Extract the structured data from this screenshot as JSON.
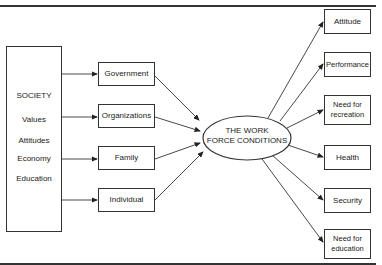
{
  "diagram": {
    "society": {
      "title": "SOCIETY",
      "items": [
        "Values",
        "Attitudes",
        "Economy",
        "Education"
      ]
    },
    "influences": [
      "Government",
      "Organizations",
      "Family",
      "Individual"
    ],
    "center": {
      "line1": "THE WORK",
      "line2": "FORCE CONDITIONS"
    },
    "outcomes": [
      {
        "line1": "Attitude",
        "line2": ""
      },
      {
        "line1": "Performance",
        "line2": ""
      },
      {
        "line1": "Need for",
        "line2": "recreation"
      },
      {
        "line1": "Health",
        "line2": ""
      },
      {
        "line1": "Security",
        "line2": ""
      },
      {
        "line1": "Need for",
        "line2": "education"
      }
    ]
  }
}
